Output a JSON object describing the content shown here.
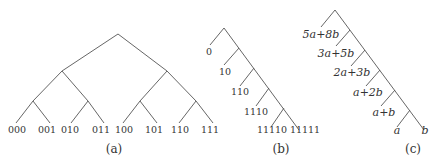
{
  "figure": {
    "panels": [
      {
        "id": "a",
        "caption": "(a)",
        "type": "complete binary tree",
        "leaves": [
          "000",
          "001",
          "010",
          "011",
          "100",
          "101",
          "110",
          "111"
        ]
      },
      {
        "id": "b",
        "caption": "(b)",
        "type": "right-skewed binary tree",
        "leaves": [
          "0",
          "10",
          "110",
          "1110",
          "11110",
          "11111"
        ]
      },
      {
        "id": "c",
        "caption": "(c)",
        "type": "right-skewed binary tree (Fibonacci weights)",
        "leaves": [
          "5a+8b",
          "3a+5b",
          "2a+3b",
          "a+2b",
          "a+b",
          "a",
          "b"
        ]
      }
    ]
  }
}
